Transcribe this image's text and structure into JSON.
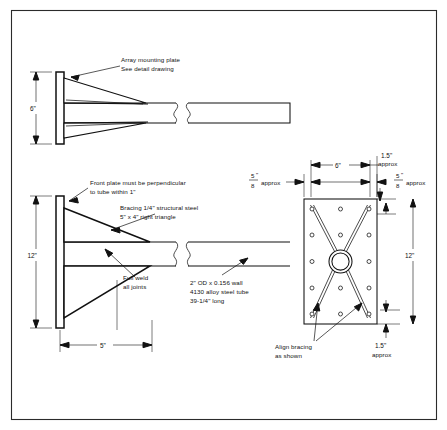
{
  "drawing": {
    "title": "Array mount assembly detail",
    "sheet_border": true
  },
  "views": {
    "top": {
      "name": "top-view",
      "dimension_height": "6\"",
      "callouts": [
        {
          "id": "array-plate",
          "lines": [
            "Array mounting plate",
            "See detail drawing"
          ]
        }
      ],
      "break_symbol": true
    },
    "side": {
      "name": "side-elevation-view",
      "dimension_height": "12\"",
      "dimension_width": "5\"",
      "callouts": [
        {
          "id": "front-plate-note",
          "lines": [
            "Front plate must be perpendicular",
            "to tube within 1\""
          ]
        },
        {
          "id": "bracing-note",
          "lines": [
            "Bracing 1/4\" structural steel",
            "5\" x 4\" right triangle"
          ]
        },
        {
          "id": "weld-note",
          "lines": [
            "Full weld",
            "all joints"
          ]
        },
        {
          "id": "tube-note",
          "lines": [
            "2\" OD x 0.156 wall",
            "4130 alloy steel tube",
            "39-1/4\" long"
          ]
        }
      ]
    },
    "plate_detail": {
      "name": "plate-detail-view",
      "dimensions": {
        "top_width": "6\"",
        "top_right_edge": {
          "value": "1.5\"",
          "qualifier": "approx"
        },
        "left_gap": {
          "numerator": "5",
          "denominator": "8",
          "unit": "\"",
          "qualifier": "approx"
        },
        "right_gap": {
          "numerator": "5",
          "denominator": "8",
          "unit": "\"",
          "qualifier": "approx"
        },
        "height": "12\"",
        "bottom_edge": {
          "value": "1.5\"",
          "qualifier": "approx"
        }
      },
      "callouts": [
        {
          "id": "align-bracing",
          "lines": [
            "Align bracing",
            "as shown"
          ]
        }
      ],
      "hole_columns": 3,
      "hole_rows": 5,
      "center_bore": true,
      "bracing_pattern": "X"
    }
  },
  "colors": {
    "line": "#111111",
    "frame": "#2b2b2b",
    "background": "#ffffff"
  }
}
